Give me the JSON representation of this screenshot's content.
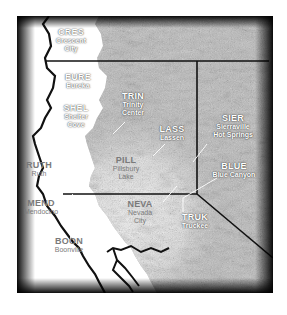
{
  "map": {
    "title": "Northern California weather stations",
    "colors": {
      "frame": "#1a1a1a",
      "terrain_light": "#e6e6e6",
      "terrain_mid": "#b8b8b8",
      "terrain_dark": "#8a8a8a",
      "ocean": "#ffffff",
      "border_line": "#111111",
      "label_light": "#ffffff",
      "label_dark": "#7a7a7a"
    },
    "stations": [
      {
        "code": "CRES",
        "name": "Crescent City",
        "style": "light"
      },
      {
        "code": "EURE",
        "name": "Eureka",
        "style": "light"
      },
      {
        "code": "TRIN",
        "name": "Trinity Center",
        "style": "light"
      },
      {
        "code": "SHEL",
        "name": "Shelter Cove",
        "style": "light"
      },
      {
        "code": "LASS",
        "name": "Lassen",
        "style": "light"
      },
      {
        "code": "SIER",
        "name": "Sierraville Hot Springs",
        "style": "light"
      },
      {
        "code": "RUTH",
        "name": "Ruth",
        "style": "dark"
      },
      {
        "code": "PILL",
        "name": "Pillsbury Lake",
        "style": "dark"
      },
      {
        "code": "BLUE",
        "name": "Blue Canyon",
        "style": "light"
      },
      {
        "code": "MEND",
        "name": "Mendocino",
        "style": "dark"
      },
      {
        "code": "NEVA",
        "name": "Nevada City",
        "style": "dark"
      },
      {
        "code": "TRUK",
        "name": "Truckee",
        "style": "light"
      },
      {
        "code": "BOON",
        "name": "Boonville",
        "style": "dark"
      }
    ],
    "name_lines": {
      "CRES": [
        "Crescent",
        "City"
      ],
      "TRIN": [
        "Trinity",
        "Center"
      ],
      "SHEL": [
        "Shelter",
        "Cove"
      ],
      "SIER": [
        "Sierraville",
        "Hot Springs"
      ],
      "PILL": [
        "Pillsbury",
        "Lake"
      ],
      "NEVA": [
        "Nevada",
        "City"
      ]
    }
  }
}
